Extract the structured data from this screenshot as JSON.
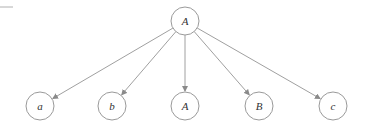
{
  "diagram": {
    "type": "tree",
    "colors": {
      "stroke": "#9a9a9a",
      "edge": "#a0a0a0",
      "label": "#333333",
      "background": "#ffffff"
    },
    "root": {
      "id": "root",
      "label": "A",
      "x": 185,
      "y": 21,
      "r": 14
    },
    "children": [
      {
        "id": "c1",
        "label": "a",
        "x": 40,
        "y": 106,
        "r": 14
      },
      {
        "id": "c2",
        "label": "b",
        "x": 112,
        "y": 106,
        "r": 14
      },
      {
        "id": "c3",
        "label": "A",
        "x": 185,
        "y": 106,
        "r": 14
      },
      {
        "id": "c4",
        "label": "B",
        "x": 259,
        "y": 106,
        "r": 14
      },
      {
        "id": "c5",
        "label": "c",
        "x": 333,
        "y": 106,
        "r": 14
      }
    ],
    "edges": [
      {
        "from": "root",
        "to": "c1"
      },
      {
        "from": "root",
        "to": "c2"
      },
      {
        "from": "root",
        "to": "c3"
      },
      {
        "from": "root",
        "to": "c4"
      },
      {
        "from": "root",
        "to": "c5"
      }
    ]
  }
}
